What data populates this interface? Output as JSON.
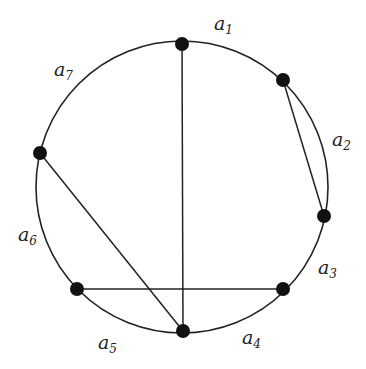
{
  "diagram": {
    "type": "circle-graph",
    "circle": {
      "cx": 182,
      "cy": 187,
      "r": 146
    },
    "nodes": [
      {
        "id": "n1",
        "x": 182,
        "y": 44
      },
      {
        "id": "n2",
        "x": 283,
        "y": 80
      },
      {
        "id": "n3",
        "x": 324,
        "y": 216
      },
      {
        "id": "n4",
        "x": 283,
        "y": 289
      },
      {
        "id": "n5",
        "x": 183,
        "y": 331
      },
      {
        "id": "n6",
        "x": 77,
        "y": 289
      },
      {
        "id": "n7",
        "x": 40,
        "y": 153
      }
    ],
    "chords": [
      {
        "from": "n1",
        "to": "n5"
      },
      {
        "from": "n2",
        "to": "n3"
      },
      {
        "from": "n7",
        "to": "n5"
      },
      {
        "from": "n6",
        "to": "n4"
      }
    ],
    "arc_labels": [
      {
        "base": "a",
        "sub": "1",
        "x": 214,
        "y": 14
      },
      {
        "base": "a",
        "sub": "2",
        "x": 332,
        "y": 130
      },
      {
        "base": "a",
        "sub": "3",
        "x": 318,
        "y": 258
      },
      {
        "base": "a",
        "sub": "4",
        "x": 242,
        "y": 328
      },
      {
        "base": "a",
        "sub": "5",
        "x": 98,
        "y": 333
      },
      {
        "base": "a",
        "sub": "6",
        "x": 18,
        "y": 225
      },
      {
        "base": "a",
        "sub": "7",
        "x": 54,
        "y": 60
      }
    ],
    "colors": {
      "stroke": "#222222",
      "node": "#111111",
      "background": "#ffffff"
    }
  }
}
